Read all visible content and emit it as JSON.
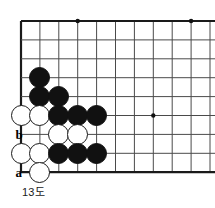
{
  "diagram": {
    "caption": "13도",
    "type": "go-board-problem",
    "board": {
      "origin_x": 21,
      "origin_y": 21,
      "spacing": 18.9,
      "cols_visible": 11,
      "rows_visible": 9,
      "edges": {
        "top": true,
        "left": true,
        "bottom": true,
        "right": false
      },
      "line_color": "#4a4a4a",
      "edge_color": "#1a1a1a",
      "background_color": "#ffffff"
    },
    "star_points": [
      {
        "name": "star-point-top-left",
        "col": 4,
        "row": 1
      },
      {
        "name": "star-point-top-right",
        "col": 10,
        "row": 1
      },
      {
        "name": "star-point-right-middle",
        "col": 8,
        "row": 6
      }
    ],
    "stones": [
      {
        "id": "stone-b-c2-r4",
        "color": "black",
        "col": 2,
        "row": 4
      },
      {
        "id": "stone-b-c2-r5",
        "color": "black",
        "col": 2,
        "row": 5
      },
      {
        "id": "stone-b-c3-r5",
        "color": "black",
        "col": 3,
        "row": 5
      },
      {
        "id": "stone-w-c1-r6",
        "color": "white",
        "col": 1,
        "row": 6
      },
      {
        "id": "stone-w-c2-r6",
        "color": "white",
        "col": 2,
        "row": 6
      },
      {
        "id": "stone-b-c3-r6",
        "color": "black",
        "col": 3,
        "row": 6
      },
      {
        "id": "stone-b-c4-r6",
        "color": "black",
        "col": 4,
        "row": 6
      },
      {
        "id": "stone-b-c5-r6",
        "color": "black",
        "col": 5,
        "row": 6
      },
      {
        "id": "stone-w-c3-r7",
        "color": "white",
        "col": 3,
        "row": 7
      },
      {
        "id": "stone-w-c4-r7",
        "color": "white",
        "col": 4,
        "row": 7
      },
      {
        "id": "stone-w-c1-r8",
        "color": "white",
        "col": 1,
        "row": 8
      },
      {
        "id": "stone-w-c2-r8",
        "color": "white",
        "col": 2,
        "row": 8
      },
      {
        "id": "stone-b-c3-r8",
        "color": "black",
        "col": 3,
        "row": 8
      },
      {
        "id": "stone-b-c4-r8",
        "color": "black",
        "col": 4,
        "row": 8
      },
      {
        "id": "stone-b-c5-r8",
        "color": "black",
        "col": 5,
        "row": 8
      },
      {
        "id": "stone-w-c2-r9",
        "color": "white",
        "col": 2,
        "row": 9
      }
    ],
    "labels": [
      {
        "id": "label-b",
        "text": "b",
        "col": 1,
        "row": 7
      },
      {
        "id": "label-a",
        "text": "a",
        "col": 1,
        "row": 9
      }
    ]
  }
}
